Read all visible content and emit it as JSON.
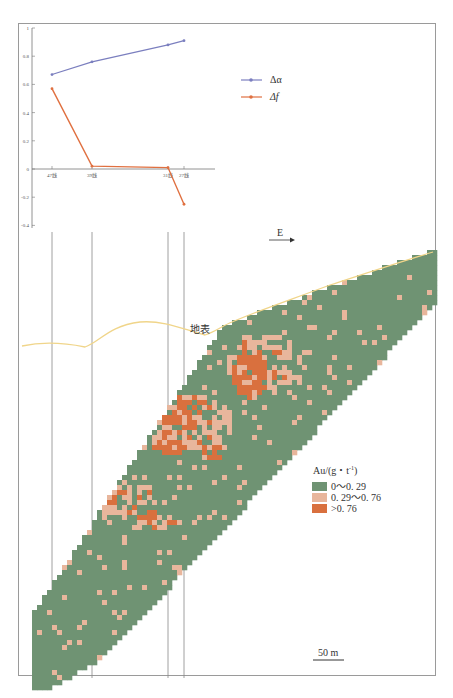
{
  "chart_data": [
    {
      "type": "line",
      "title": "",
      "xlabel": "",
      "ylabel": "",
      "categories": [
        "47线",
        "39线",
        "31线",
        "27线"
      ],
      "x_positions_px": [
        52,
        92,
        168,
        184
      ],
      "series": [
        {
          "name": "Δα",
          "color": "#7b7fbf",
          "values": [
            0.67,
            0.76,
            0.88,
            0.91
          ]
        },
        {
          "name": "Δf",
          "color": "#e07040",
          "values": [
            0.57,
            0.02,
            0.01,
            -0.25
          ]
        }
      ],
      "ylim": [
        -0.4,
        1.0
      ],
      "yticks": [
        "1",
        "0.8",
        "0.6",
        "0.4",
        "0.2",
        "0",
        "-0.2",
        "-0.4"
      ],
      "legend_position": "upper right",
      "grid": false
    },
    {
      "type": "heatmap",
      "title": "Au grade cross-section",
      "direction_label": "E",
      "surface_label": "地表",
      "legend_title": "Au/(g・t⁻¹)",
      "classes": [
        {
          "label": "0～0. 29",
          "color": "#6f9373"
        },
        {
          "label": "0. 29～0. 76",
          "color": "#e8b69c"
        },
        {
          "label": ">0. 76",
          "color": "#d9703e"
        }
      ],
      "scale_bar": "50 m",
      "exploration_lines": [
        "47线",
        "39线",
        "31线",
        "27线"
      ]
    }
  ],
  "legend": {
    "series": [
      {
        "label": "Δα",
        "color": "#7b7fbf"
      },
      {
        "label": "Δf",
        "color": "#e07040"
      }
    ]
  },
  "section": {
    "direction": "E",
    "surface": "地表",
    "scale": "50 m",
    "grade_title": "Au/(g・t⁻¹)",
    "grade_classes": [
      "0～0. 29",
      "0. 29～0. 76",
      ">0. 76"
    ]
  },
  "colors": {
    "low": "#6f9373",
    "mid": "#e8b69c",
    "high": "#d9703e",
    "surface": "#f0d58a",
    "da": "#7b7fbf",
    "df": "#e07040"
  }
}
